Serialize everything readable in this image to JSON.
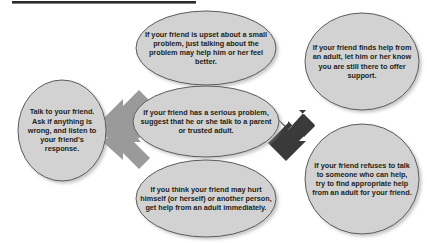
{
  "diagram": {
    "title_bar": {
      "name": "top-rule"
    },
    "colors": {
      "node_fill": "#d2d2d2",
      "node_stroke": "#5b5b5b",
      "arrow_light": "#9a9a9a",
      "arrow_dark": "#3a3a3a",
      "text": "#231f20",
      "background": "#ffffff"
    },
    "nodes": [
      {
        "id": "start",
        "shape": "ellipse",
        "text": "Talk to your friend. Ask if anything is wrong, and listen to your friend's response."
      },
      {
        "id": "small_problem",
        "shape": "ellipse",
        "text": "If your friend is upset about a small problem, just talking about the problem may help him or her feel better."
      },
      {
        "id": "serious_problem",
        "shape": "ellipse",
        "text": "If your friend has a serious problem, suggest that he or she talk to a parent or trusted adult."
      },
      {
        "id": "hurt_self",
        "shape": "ellipse",
        "text": "If you think your friend may hurt himself (or herself) or another person, get help from an adult immediately."
      },
      {
        "id": "finds_help",
        "shape": "ellipse",
        "text": "If your friend finds help from an adult, let him or her know you are still there to offer support."
      },
      {
        "id": "refuses_help",
        "shape": "ellipse",
        "text": "If your friend refuses to talk to someone who can help, try to find appropriate help from an adult for your friend."
      }
    ],
    "connectors": [
      {
        "id": "start-to-small",
        "from": "start",
        "to": "small_problem",
        "style": "light"
      },
      {
        "id": "start-to-serious",
        "from": "start",
        "to": "serious_problem",
        "style": "light"
      },
      {
        "id": "start-to-hurt",
        "from": "start",
        "to": "hurt_self",
        "style": "light"
      },
      {
        "id": "serious-to-finds",
        "from": "serious_problem",
        "to": "finds_help",
        "style": "dark"
      },
      {
        "id": "serious-to-refuses",
        "from": "serious_problem",
        "to": "refuses_help",
        "style": "dark"
      }
    ]
  }
}
